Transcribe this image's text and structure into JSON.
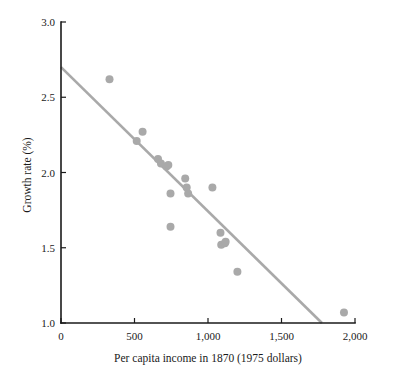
{
  "chart_data": {
    "type": "scatter",
    "title": "",
    "xlabel": "Per capita income in 1870 (1975 dollars)",
    "ylabel": "Growth rate (%)",
    "xlim": [
      0,
      2000
    ],
    "ylim": [
      1.0,
      3.0
    ],
    "grid": false,
    "legend": null,
    "xticks": [
      0,
      500,
      1000,
      1500,
      2000
    ],
    "xtick_labels": [
      "0",
      "500",
      "1,000",
      "1,500",
      "2,000"
    ],
    "yticks": [
      1.0,
      1.5,
      2.0,
      2.5,
      3.0
    ],
    "ytick_labels": [
      "1.0",
      "1.5",
      "2.0",
      "2.5",
      "3.0"
    ],
    "point_color": "#a9a9a9",
    "line_color": "#a9a9a9",
    "axis_color": "#1a1a1a",
    "marker_radius": 4.0,
    "points": [
      {
        "x": 330,
        "y": 2.62
      },
      {
        "x": 515,
        "y": 2.21
      },
      {
        "x": 555,
        "y": 2.27
      },
      {
        "x": 660,
        "y": 2.09
      },
      {
        "x": 680,
        "y": 2.06
      },
      {
        "x": 718,
        "y": 2.04
      },
      {
        "x": 730,
        "y": 2.05
      },
      {
        "x": 745,
        "y": 1.86
      },
      {
        "x": 745,
        "y": 1.64
      },
      {
        "x": 845,
        "y": 1.96
      },
      {
        "x": 855,
        "y": 1.9
      },
      {
        "x": 865,
        "y": 1.86
      },
      {
        "x": 1030,
        "y": 1.9
      },
      {
        "x": 1085,
        "y": 1.6
      },
      {
        "x": 1090,
        "y": 1.52
      },
      {
        "x": 1115,
        "y": 1.53
      },
      {
        "x": 1120,
        "y": 1.54
      },
      {
        "x": 1200,
        "y": 1.34
      },
      {
        "x": 1925,
        "y": 1.07
      }
    ],
    "trend_line": {
      "x_start": 0,
      "y_start": 2.7,
      "x_end": 1775,
      "y_end": 1.0
    }
  }
}
